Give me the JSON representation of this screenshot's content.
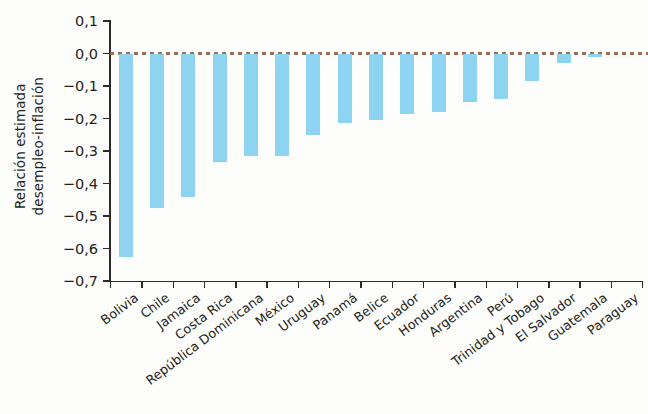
{
  "chart_data": {
    "type": "bar",
    "title": "",
    "subtitle": "",
    "xlabel": "",
    "ylabel_lines": [
      "Relación estimada",
      "desempleo-inflación"
    ],
    "ylabel": "Relación estimada desempleo-inflación",
    "categories": [
      "Bolivia",
      "Chile",
      "Jamaica",
      "Costa Rica",
      "República Dominicana",
      "México",
      "Uruguay",
      "Panamá",
      "Belice",
      "Ecuador",
      "Honduras",
      "Argentina",
      "Perú",
      "Trinidad y Tobago",
      "El Salvador",
      "Guatemala",
      "Paraguay"
    ],
    "values": [
      -0.625,
      -0.475,
      -0.44,
      -0.335,
      -0.315,
      -0.315,
      -0.25,
      -0.215,
      -0.205,
      -0.185,
      -0.18,
      -0.15,
      -0.14,
      -0.085,
      -0.03,
      -0.01,
      0.0
    ],
    "ylim": [
      -0.7,
      0.1
    ],
    "ytick_values": [
      0.1,
      0.0,
      -0.1,
      -0.2,
      -0.3,
      -0.4,
      -0.5,
      -0.6,
      -0.7
    ],
    "ytick_labels": [
      "0,1",
      "0,0",
      "−0,1",
      "−0,2",
      "−0,3",
      "−0,4",
      "−0,5",
      "−0,6",
      "−0,7"
    ],
    "grid": false,
    "legend": null,
    "legend_position": "none",
    "bar_color": "#8ed3f0",
    "zero_line": {
      "value": 0.0,
      "style": "dashed",
      "color": "#9c6b52"
    },
    "axis_color": "#2c2a28",
    "background_color": "#fdfdfb",
    "xtick_style": "between-categories",
    "xlabel_rotation": -37
  }
}
